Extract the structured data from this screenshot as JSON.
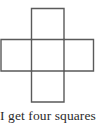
{
  "figure": {
    "name": "cross-net-of-cube",
    "stroke_color": "#5a5a5a",
    "fill_color": "#ffffff",
    "stroke_width": 1.4,
    "unit_square_px": 31,
    "squares": [
      {
        "label": "top-square",
        "x": 31.5,
        "y": 8.5,
        "w": 32.5,
        "h": 31.0
      },
      {
        "label": "left-square",
        "x": 1.0,
        "y": 39.5,
        "w": 30.5,
        "h": 31.5
      },
      {
        "label": "center-square",
        "x": 31.5,
        "y": 39.5,
        "w": 32.5,
        "h": 31.5
      },
      {
        "label": "right-square",
        "x": 64.0,
        "y": 39.5,
        "w": 29.5,
        "h": 31.5
      },
      {
        "label": "bottom-square",
        "x": 31.5,
        "y": 71.0,
        "w": 32.5,
        "h": 31.0
      }
    ],
    "outline_path": "M31.5 8.5 L64 8.5 L64 39.5 L93.5 39.5 L93.5 71 L64 71 L64 102 L31.5 102 L31.5 71 L1 71 L1 39.5 L31.5 39.5 Z",
    "inner_lines": [
      {
        "label": "vertical-left-crease",
        "x1": 31.5,
        "y1": 39.5,
        "x2": 31.5,
        "y2": 71.0
      },
      {
        "label": "vertical-right-crease",
        "x1": 64.0,
        "y1": 39.5,
        "x2": 64.0,
        "y2": 71.0
      },
      {
        "label": "horizontal-top-crease",
        "x1": 31.5,
        "y1": 39.5,
        "x2": 64.0,
        "y2": 39.5
      },
      {
        "label": "horizontal-bottom-crease",
        "x1": 31.5,
        "y1": 71.0,
        "x2": 64.0,
        "y2": 71.0
      }
    ]
  },
  "caption": {
    "text": "I get four squares"
  },
  "page": {
    "background_color": "#ffffff",
    "text_color": "#2b2b2b"
  }
}
